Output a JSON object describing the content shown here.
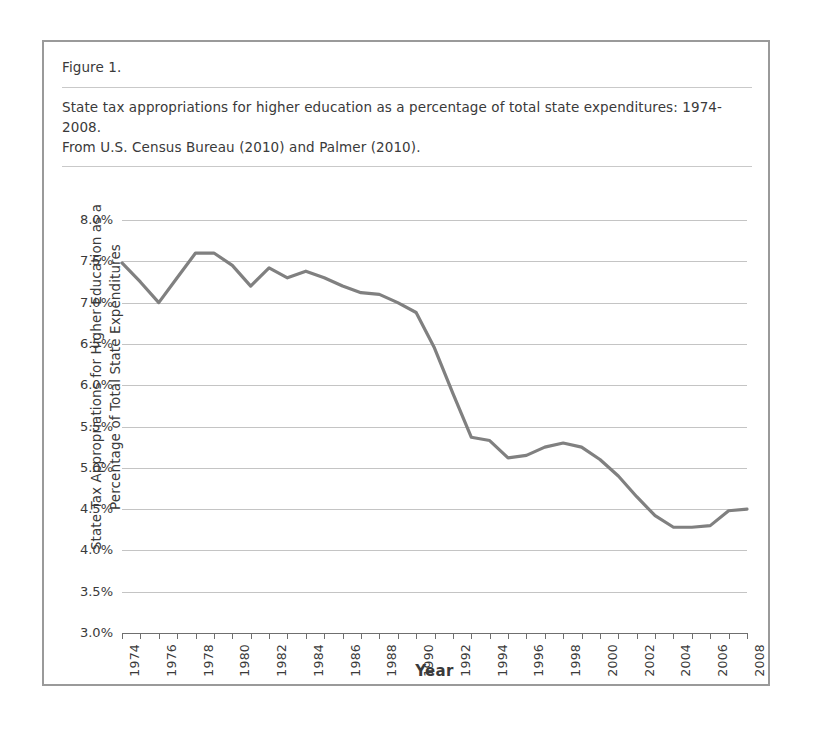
{
  "figure": {
    "number_label": "Figure 1.",
    "caption_line1": "State tax appropriations for higher education as a percentage of total state expenditures: 1974-2008.",
    "caption_line2": "From U.S. Census Bureau (2010) and Palmer (2010)."
  },
  "axis": {
    "y_title_line1": "State Tax Appropriations for Higher Education as a",
    "y_title_line2": "Percentage of Total State Expenditures",
    "x_title": "Year"
  },
  "colors": {
    "line": "#808080",
    "gridline": "#c4c4c4",
    "frame": "#9a9a9a",
    "text": "#3a3a3a",
    "background": "#ffffff"
  },
  "chart_data": {
    "type": "line",
    "title": "State tax appropriations for higher education as a percentage of total state expenditures: 1974-2008.",
    "subtitle": "From U.S. Census Bureau (2010) and Palmer (2010).",
    "xlabel": "Year",
    "ylabel": "State Tax Appropriations for Higher Education as a Percentage of Total State Expenditures",
    "xlim": [
      1974,
      2008
    ],
    "ylim": [
      3.0,
      8.0
    ],
    "y_tick_labels": [
      "8.0%",
      "7.5%",
      "7.0%",
      "6.5%",
      "6.0%",
      "5.5%",
      "5.0%",
      "4.5%",
      "4.0%",
      "3.5%",
      "3.0%"
    ],
    "y_tick_values": [
      8.0,
      7.5,
      7.0,
      6.5,
      6.0,
      5.5,
      5.0,
      4.5,
      4.0,
      3.5,
      3.0
    ],
    "y_unit": "%",
    "x_tick_labels": [
      "1974",
      "1976",
      "1978",
      "1980",
      "1982",
      "1984",
      "1986",
      "1988",
      "1990",
      "1992",
      "1994",
      "1996",
      "1998",
      "2000",
      "2002",
      "2004",
      "2006",
      "2008"
    ],
    "x_tick_values": [
      1974,
      1976,
      1978,
      1980,
      1982,
      1984,
      1986,
      1988,
      1990,
      1992,
      1994,
      1996,
      1998,
      2000,
      2002,
      2004,
      2006,
      2008
    ],
    "x_minor_ticks_every": 1,
    "grid": "horizontal",
    "legend": "none",
    "x": [
      1974,
      1975,
      1976,
      1977,
      1978,
      1979,
      1980,
      1981,
      1982,
      1983,
      1984,
      1985,
      1986,
      1987,
      1988,
      1989,
      1990,
      1991,
      1992,
      1993,
      1994,
      1995,
      1996,
      1997,
      1998,
      1999,
      2000,
      2001,
      2002,
      2003,
      2004,
      2005,
      2006,
      2007,
      2008
    ],
    "values": [
      7.48,
      7.25,
      7.0,
      7.3,
      7.6,
      7.6,
      7.45,
      7.2,
      7.42,
      7.3,
      7.38,
      7.3,
      7.2,
      7.12,
      7.1,
      7.0,
      6.88,
      6.45,
      5.9,
      5.37,
      5.33,
      5.12,
      5.15,
      5.25,
      5.3,
      5.25,
      5.1,
      4.9,
      4.65,
      4.42,
      4.28,
      4.28,
      4.3,
      4.48,
      4.5
    ],
    "series": [
      {
        "name": "State tax appropriations for higher education (% of total state expenditures)",
        "values": [
          7.48,
          7.25,
          7.0,
          7.3,
          7.6,
          7.6,
          7.45,
          7.2,
          7.42,
          7.3,
          7.38,
          7.3,
          7.2,
          7.12,
          7.1,
          7.0,
          6.88,
          6.45,
          5.9,
          5.37,
          5.33,
          5.12,
          5.15,
          5.25,
          5.3,
          5.25,
          5.1,
          4.9,
          4.65,
          4.42,
          4.28,
          4.28,
          4.3,
          4.48,
          4.5
        ]
      }
    ]
  }
}
